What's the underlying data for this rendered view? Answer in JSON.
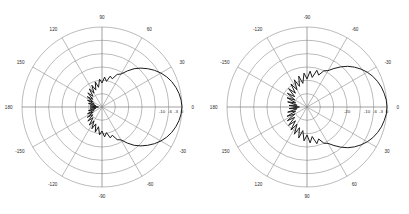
{
  "figure": {
    "background_color": "#ffffff",
    "grid_color": "#8d8d8d",
    "curve_color": "#1c1c1c",
    "label_color": "#2b2b2b"
  },
  "chart_data": [
    {
      "type": "line",
      "plot_kind": "polar",
      "title": "",
      "subtitle": "",
      "xlabel": "",
      "ylabel": "",
      "panel_index": 0,
      "panel_name": "left-polar-plot",
      "angular_unit": "degrees",
      "angular_tick_labels": [
        "0",
        "30",
        "60",
        "90",
        "120",
        "150",
        "180",
        "-150",
        "-120",
        "-90",
        "-60",
        "-30"
      ],
      "angular_tick_values": [
        0,
        30,
        60,
        90,
        120,
        150,
        180,
        -150,
        -120,
        -90,
        -60,
        -30
      ],
      "angular_direction": "counterclockwise",
      "angular_zero_at": "east",
      "radial_tick_labels": [
        "-10",
        "-6",
        "-3",
        "0"
      ],
      "radial_tick_values": [
        -10,
        -6,
        -3,
        0
      ],
      "radial_unit": "dB",
      "rlim": [
        -40,
        0
      ],
      "ring_count": 6,
      "spoke_count": 12,
      "grid": "on",
      "legend": "none",
      "series": [
        {
          "name": "radiation-pattern",
          "peak_gain_db": 0,
          "peak_angle_deg": 0,
          "beamwidth_3db_deg": 62,
          "theta": [
            -180,
            -175,
            -170,
            -165,
            -160,
            -155,
            -150,
            -145,
            -140,
            -135,
            -130,
            -125,
            -120,
            -115,
            -110,
            -105,
            -100,
            -95,
            -90,
            -85,
            -80,
            -75,
            -70,
            -65,
            -60,
            -55,
            -50,
            -45,
            -40,
            -35,
            -30,
            -25,
            -20,
            -15,
            -10,
            -5,
            0,
            5,
            10,
            15,
            20,
            25,
            30,
            35,
            40,
            45,
            50,
            55,
            60,
            65,
            70,
            75,
            80,
            85,
            90,
            95,
            100,
            105,
            110,
            115,
            120,
            125,
            130,
            135,
            140,
            145,
            150,
            155,
            160,
            165,
            170,
            175,
            180
          ],
          "values_db": [
            -38,
            -34,
            -37,
            -33,
            -36,
            -32,
            -35,
            -31,
            -34,
            -30,
            -33,
            -29,
            -32,
            -28,
            -31,
            -27,
            -30,
            -26,
            -28,
            -25,
            -27,
            -24,
            -25,
            -22,
            -21,
            -18,
            -15,
            -12.5,
            -10.2,
            -8.0,
            -6.0,
            -4.3,
            -2.9,
            -1.8,
            -0.9,
            -0.3,
            0.0,
            -0.3,
            -0.9,
            -1.8,
            -2.9,
            -4.3,
            -6.0,
            -8.0,
            -10.2,
            -12.5,
            -15,
            -18,
            -21,
            -22,
            -25,
            -24,
            -27,
            -25,
            -28,
            -26,
            -30,
            -27,
            -31,
            -28,
            -32,
            -29,
            -33,
            -30,
            -34,
            -31,
            -35,
            -32,
            -36,
            -33,
            -37,
            -34,
            -38
          ]
        }
      ]
    },
    {
      "type": "line",
      "plot_kind": "polar",
      "title": "",
      "subtitle": "",
      "xlabel": "",
      "ylabel": "",
      "panel_index": 1,
      "panel_name": "right-polar-plot",
      "angular_unit": "degrees",
      "angular_tick_labels": [
        "0",
        "-30",
        "-60",
        "-90",
        "-120",
        "-150",
        "180",
        "150",
        "120",
        "90",
        "60",
        "30"
      ],
      "angular_tick_values": [
        0,
        -30,
        -60,
        -90,
        -120,
        -150,
        180,
        150,
        120,
        90,
        60,
        30
      ],
      "angular_direction": "clockwise",
      "angular_zero_at": "east",
      "radial_tick_labels": [
        "-20",
        "-10",
        "-6",
        "-3",
        "0"
      ],
      "radial_tick_values": [
        -20,
        -10,
        -6,
        -3,
        0
      ],
      "radial_unit": "dB",
      "rlim": [
        -40,
        0
      ],
      "ring_count": 6,
      "spoke_count": 12,
      "grid": "on",
      "legend": "none",
      "series": [
        {
          "name": "radiation-pattern",
          "peak_gain_db": 0,
          "peak_angle_deg": 0,
          "beamwidth_3db_deg": 56,
          "theta": [
            -180,
            -175,
            -170,
            -165,
            -160,
            -155,
            -150,
            -145,
            -140,
            -135,
            -130,
            -125,
            -120,
            -115,
            -110,
            -105,
            -100,
            -95,
            -90,
            -85,
            -80,
            -75,
            -70,
            -65,
            -60,
            -55,
            -50,
            -45,
            -40,
            -35,
            -30,
            -25,
            -20,
            -15,
            -10,
            -5,
            0,
            5,
            10,
            15,
            20,
            25,
            30,
            35,
            40,
            45,
            50,
            55,
            60,
            65,
            70,
            75,
            80,
            85,
            90,
            95,
            100,
            105,
            110,
            115,
            120,
            125,
            130,
            135,
            140,
            145,
            150,
            155,
            160,
            165,
            170,
            175,
            180
          ],
          "values_db": [
            -36,
            -31,
            -35,
            -30,
            -34,
            -29,
            -33,
            -28,
            -32,
            -27,
            -31,
            -26,
            -30,
            -25,
            -29,
            -24,
            -28,
            -23,
            -26,
            -22,
            -25,
            -21,
            -23,
            -20,
            -19,
            -16.5,
            -13.8,
            -11.2,
            -9.0,
            -7.0,
            -5.2,
            -3.7,
            -2.5,
            -1.5,
            -0.8,
            -0.2,
            0.0,
            -0.2,
            -0.8,
            -1.5,
            -2.5,
            -3.7,
            -5.2,
            -7.0,
            -9.0,
            -11.2,
            -13.8,
            -16.5,
            -19,
            -20,
            -23,
            -21,
            -25,
            -22,
            -26,
            -23,
            -28,
            -24,
            -29,
            -25,
            -30,
            -26,
            -31,
            -27,
            -32,
            -28,
            -33,
            -29,
            -34,
            -30,
            -35,
            -31,
            -36
          ]
        }
      ]
    }
  ]
}
